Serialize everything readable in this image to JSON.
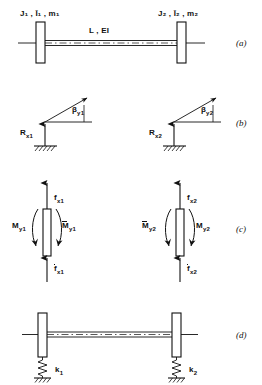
{
  "figure": {
    "ink_color": "#111111",
    "background": "#ffffff"
  },
  "panels": [
    {
      "tag": "(a)",
      "name": "rotor-assembly",
      "description": "Shaft of length L and bending stiffness EI carrying two discs",
      "labels": {
        "left_disc": "J₁ , Ī₁ , m₁",
        "right_disc": "J₂ , Ī₂ , m₂",
        "shaft": "L , EI"
      }
    },
    {
      "tag": "(b)",
      "name": "reaction-angle-diagram",
      "description": "Support reactions and slope angles at each station",
      "labels": {
        "reaction_left": "R",
        "reaction_left_sub": "x1",
        "reaction_right": "R",
        "reaction_right_sub": "x2",
        "angle_left": "β",
        "angle_left_sub": "y1",
        "angle_right": "β",
        "angle_right_sub": "y2"
      }
    },
    {
      "tag": "(c)",
      "name": "free-body-diagram",
      "description": "Forces and moments acting on each disc element",
      "labels": {
        "force_top_left": "f",
        "force_top_left_sub": "x1",
        "force_bottom_left": "f",
        "force_bottom_left_sub": "x1",
        "moment_left_outer": "M",
        "moment_left_outer_sub": "y1",
        "moment_left_inner": "M",
        "moment_left_inner_sub": "y1",
        "force_top_right": "f",
        "force_top_right_sub": "x2",
        "force_bottom_right": "f",
        "force_bottom_right_sub": "x2",
        "moment_right_inner": "M",
        "moment_right_inner_sub": "y2",
        "moment_right_outer": "M",
        "moment_right_outer_sub": "y2"
      }
    },
    {
      "tag": "(d)",
      "name": "spring-supported-rotor",
      "description": "Shaft with discs carried on elastic supports",
      "labels": {
        "spring_left": "k",
        "spring_left_sub": "1",
        "spring_right": "k",
        "spring_right_sub": "2"
      }
    }
  ]
}
